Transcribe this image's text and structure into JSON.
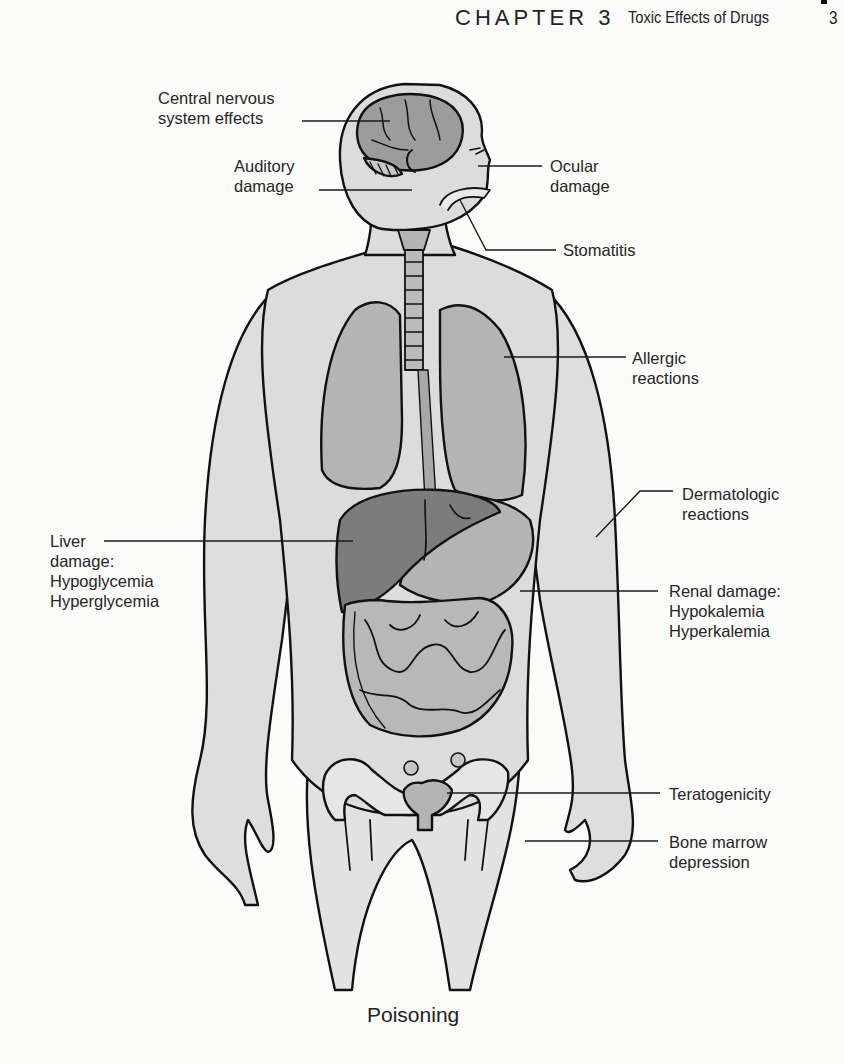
{
  "header": {
    "chapter": "CHAPTER 3",
    "section_title": "Toxic Effects of Drugs",
    "page_number": "3"
  },
  "figure": {
    "caption": "Poisoning",
    "labels": {
      "cns": {
        "lines": [
          "Central nervous",
          "system effects"
        ]
      },
      "auditory": {
        "lines": [
          "Auditory",
          "damage"
        ]
      },
      "ocular": {
        "lines": [
          "Ocular",
          "damage"
        ]
      },
      "stomatitis": {
        "lines": [
          "Stomatitis"
        ]
      },
      "allergic": {
        "lines": [
          "Allergic",
          "reactions"
        ]
      },
      "dermatologic": {
        "lines": [
          "Dermatologic",
          "reactions"
        ]
      },
      "liver": {
        "lines": [
          "Liver",
          "damage:",
          "Hypoglycemia",
          "Hyperglycemia"
        ]
      },
      "renal": {
        "lines": [
          "Renal damage:",
          "Hypokalemia",
          "Hyperkalemia"
        ]
      },
      "teratogenicity": {
        "lines": [
          "Teratogenicity"
        ]
      },
      "bone_marrow": {
        "lines": [
          "Bone marrow",
          "depression"
        ]
      }
    },
    "colors": {
      "skin": "#dcdcdc",
      "organ": "#b4b4b4",
      "brain": "#9c9c9c",
      "liver": "#7c7c7c",
      "outline": "#111111"
    }
  }
}
